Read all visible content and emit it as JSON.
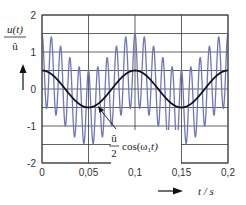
{
  "chart_data": {
    "type": "line",
    "title": "",
    "xlabel": "t / s",
    "ylabel": "u(t) / û",
    "xlim": [
      0,
      0.2
    ],
    "ylim": [
      -2,
      2
    ],
    "x_ticks": [
      "0",
      "0,05",
      "0,1",
      "0,15",
      "0,2"
    ],
    "y_ticks": [
      "2",
      "1",
      "0",
      "-1",
      "-2"
    ],
    "grid": true,
    "grid_minor_y_step": 0.5,
    "annotation": {
      "text_numerator": "û",
      "text_denominator": "2",
      "text_function": "cos(ω₁t)",
      "points_to": [
        0.055,
        -0.48
      ]
    },
    "series": [
      {
        "name": "u(t)/û",
        "color": "#6e78b8",
        "formula": "0.5*cos(2*pi*10*t) + cos(2*pi*100*t)",
        "carrier_frequency_hz": 100,
        "envelope_max": 1.5,
        "envelope_min": -1.5
      },
      {
        "name": "û/2 · cos(ω₁t)",
        "color": "#111111",
        "formula": "0.5*cos(2*pi*10*t)",
        "frequency_hz": 10,
        "amplitude": 0.5
      }
    ]
  },
  "labels": {
    "y_num": "u(t)",
    "y_den": "û",
    "x_label": "t / s",
    "ann_num": "û",
    "ann_den": "2",
    "ann_fn": "cos(ω",
    "ann_sub": "1",
    "ann_fn_end": "t)"
  },
  "colors": {
    "signal": "#6e78b8",
    "cosine": "#111111",
    "grid": "#3a3a3a",
    "text": "#333333"
  }
}
